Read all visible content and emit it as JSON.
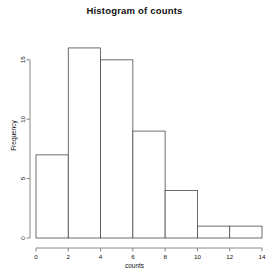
{
  "chart_data": {
    "type": "bar",
    "title": "Histogram of counts",
    "xlabel": "counts",
    "ylabel": "Frequency",
    "bin_edges": [
      0,
      2,
      4,
      6,
      8,
      10,
      12,
      14
    ],
    "categories": [
      "0-2",
      "2-4",
      "4-6",
      "6-8",
      "8-10",
      "10-12",
      "12-14"
    ],
    "values": [
      7,
      16,
      15,
      9,
      4,
      1,
      1
    ],
    "xticks": [
      "0",
      "2",
      "4",
      "6",
      "8",
      "10",
      "12",
      "14"
    ],
    "xtick_values": [
      0,
      2,
      4,
      6,
      8,
      10,
      12,
      14
    ],
    "yticks": [
      "0",
      "5",
      "10",
      "15"
    ],
    "ytick_values": [
      0,
      5,
      10,
      15
    ],
    "xlim": [
      0,
      14
    ],
    "ylim": [
      0,
      16.5
    ],
    "grid": false,
    "legend": false,
    "bar_fill_color": "#ffffff",
    "bar_border_color": "#4a4a4a",
    "axis_color": "#6b6b6b",
    "text_color": "#111111",
    "background_color": "#ffffff"
  }
}
